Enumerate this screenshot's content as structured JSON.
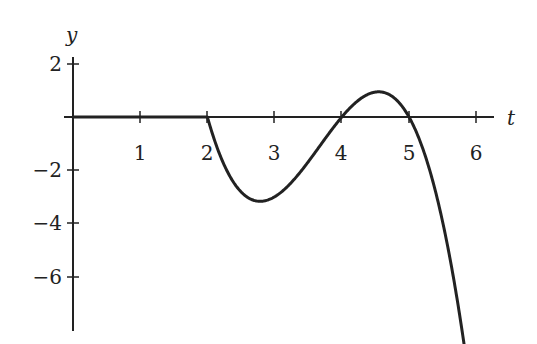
{
  "chart_data": {
    "type": "line",
    "title": "",
    "xlabel": "t",
    "ylabel": "y",
    "xlim": [
      0,
      6.2
    ],
    "ylim": [
      -8,
      2
    ],
    "x_ticks": [
      1,
      2,
      3,
      4,
      5,
      6
    ],
    "x_tick_labels": [
      "1",
      "2",
      "3",
      "4",
      "5",
      "6"
    ],
    "y_ticks": [
      2,
      -2,
      -4,
      -6
    ],
    "y_tick_labels": [
      "2",
      "−2",
      "−4",
      "−6"
    ],
    "grid": false,
    "legend": null,
    "series": [
      {
        "name": "y(t)",
        "description": "y = 0 for 0 ≤ t ≤ 2; y = -1.5(t-2)(t-4)(t-5) for t ≥ 2",
        "points": [
          [
            0,
            0
          ],
          [
            1,
            0
          ],
          [
            2,
            0
          ],
          [
            2.25,
            -1.52
          ],
          [
            2.5,
            -2.44
          ],
          [
            2.82,
            -3.1
          ],
          [
            3,
            -3.0
          ],
          [
            3.5,
            -2.25
          ],
          [
            4,
            0
          ],
          [
            4.3,
            0.7
          ],
          [
            4.58,
            0.97
          ],
          [
            4.8,
            0.65
          ],
          [
            5,
            0
          ],
          [
            5.3,
            -1.9
          ],
          [
            5.5,
            -4.3
          ],
          [
            5.8,
            -8.0
          ]
        ],
        "zeros": [
          2,
          4,
          5
        ],
        "local_min": [
          2.82,
          -3.1
        ],
        "local_max": [
          4.58,
          0.97
        ]
      }
    ]
  },
  "labels": {
    "x_axis": "t",
    "y_axis": "y",
    "x_ticks": [
      "1",
      "2",
      "3",
      "4",
      "5",
      "6"
    ],
    "y_ticks": [
      "2",
      "−2",
      "−4",
      "−6"
    ]
  }
}
